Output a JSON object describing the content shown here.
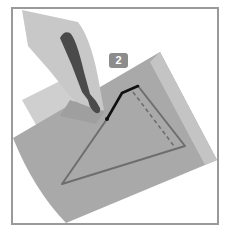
{
  "figure": {
    "kind": "instruction-illustration",
    "step_badge": {
      "label": "2",
      "icon": "step-number-badge"
    },
    "colors": {
      "frame_border": "#9a9a9a",
      "background": "#ffffff",
      "main_sheet": "#a9a9a9",
      "sheet_highlight": "#c4c4c4",
      "back_sheet": "#cfcfcf",
      "hand": "#c8c8c8",
      "hand_shadow": "#9f9f9f",
      "knife_handle": "#4a4a4a",
      "triangle_outline": "#6e6e6e",
      "dashed_fold_line": "#6e6e6e",
      "cut_line": "#111111",
      "badge_fill": "#8c8c8c"
    },
    "elements": {
      "frame": "frame-border",
      "hand": "hand-icon",
      "knife": "craft-knife-icon",
      "sheet": "paper-sheet",
      "triangle": "triangle-outline",
      "fold": "dashed-fold-line",
      "cut": "cut-line"
    }
  }
}
